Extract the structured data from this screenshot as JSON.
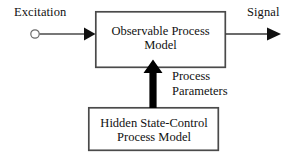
{
  "figure": {
    "type": "block-diagram",
    "background_color": "#ffffff",
    "ink_color": "#000000"
  },
  "nodes": {
    "excitation_source": {
      "label": "Excitation",
      "icon": "open-circle-node",
      "circle": {
        "cx": 35,
        "cy": 34,
        "r": 4.2,
        "fill": "#ffffff",
        "stroke": "#6b6b6b"
      }
    },
    "observable_box": {
      "line1": "Observable Process",
      "line2": "Model",
      "rect": {
        "x": 95,
        "y": 11,
        "w": 131,
        "h": 57
      },
      "stroke": "#4a4a4a",
      "stroke_width": 1.6,
      "fill": "#ffffff"
    },
    "hidden_box": {
      "line1": "Hidden State-Control",
      "line2": "Process Model",
      "rect": {
        "x": 88,
        "y": 107,
        "w": 131,
        "h": 44
      },
      "stroke": "#4a4a4a",
      "stroke_width": 1.6,
      "fill": "#ffffff"
    },
    "signal_output": {
      "label": "Signal"
    }
  },
  "edges": {
    "excitation_to_observable": {
      "label": "",
      "from": "excitation_source",
      "to": "observable_box",
      "style": "thin-line-solid-arrowhead",
      "color": "#4a4a4a",
      "x1": 40,
      "y1": 34,
      "x2": 95,
      "y2": 34
    },
    "observable_to_signal": {
      "label": "Signal",
      "from": "observable_box",
      "to": "signal_output",
      "style": "thin-line-solid-arrowhead",
      "color": "#2a2a2a",
      "x1": 226,
      "y1": 34,
      "x2": 281,
      "y2": 34
    },
    "hidden_to_observable": {
      "label_line1": "Process",
      "label_line2": "Parameters",
      "from": "hidden_box",
      "to": "observable_box",
      "style": "thick-block-arrow-up",
      "color": "#000000",
      "x": 153,
      "y_bottom": 107,
      "y_top": 60,
      "shaft_width": 7,
      "head_width": 19,
      "head_height": 14
    }
  }
}
